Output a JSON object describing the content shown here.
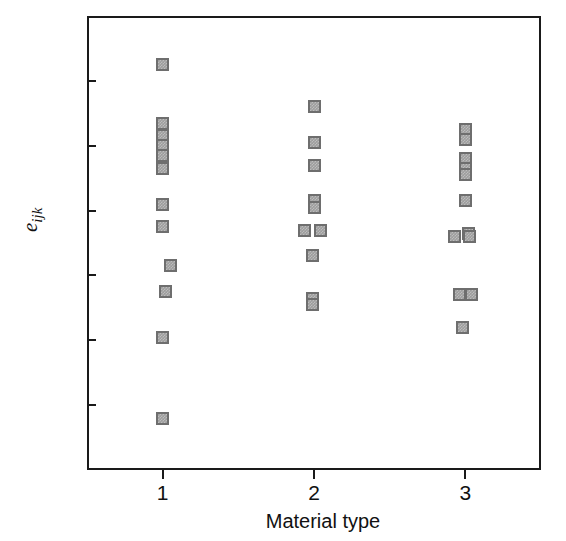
{
  "chart_data": {
    "type": "scatter",
    "title": "",
    "xlabel": "Material type",
    "ylabel": "e_ijk",
    "ylabel_parts": {
      "base": "e",
      "subscript": "ijk"
    },
    "xlim": [
      0.5,
      3.5
    ],
    "ylim": [
      -80,
      60
    ],
    "grid": false,
    "legend": null,
    "x_tick_labels": [
      "1",
      "2",
      "3"
    ],
    "x_tick_values": [
      1,
      2,
      3
    ],
    "y_tick_labels": [
      "60",
      "40",
      "20",
      "0",
      "−20",
      "−40",
      "−60",
      "−80"
    ],
    "y_tick_values": [
      60,
      40,
      20,
      0,
      -20,
      -40,
      -60,
      -80
    ],
    "marker": {
      "shape": "square",
      "fill_color": "#9d9d9d",
      "edge_color": "#6e6e6e",
      "size_px": 13
    },
    "frame_color": "#1a1a1a",
    "background_color": "#ffffff",
    "series": [
      {
        "name": "Material type 1",
        "x": 1,
        "values": [
          45,
          27,
          23,
          20,
          17,
          13,
          2,
          -5,
          -17,
          -25,
          -39,
          -64
        ],
        "points": [
          {
            "x": 1.0,
            "y": 45
          },
          {
            "x": 1.0,
            "y": 27
          },
          {
            "x": 1.0,
            "y": 23
          },
          {
            "x": 1.0,
            "y": 20
          },
          {
            "x": 1.0,
            "y": 17
          },
          {
            "x": 1.0,
            "y": 13
          },
          {
            "x": 1.0,
            "y": 2
          },
          {
            "x": 1.0,
            "y": -5
          },
          {
            "x": 1.05,
            "y": -17
          },
          {
            "x": 1.02,
            "y": -25
          },
          {
            "x": 1.0,
            "y": -39
          },
          {
            "x": 1.0,
            "y": -64
          }
        ]
      },
      {
        "name": "Material type 2",
        "x": 2,
        "values": [
          32,
          21,
          14,
          3,
          1,
          -6,
          -6,
          -14,
          -27,
          -29
        ],
        "points": [
          {
            "x": 2.0,
            "y": 32
          },
          {
            "x": 2.0,
            "y": 21
          },
          {
            "x": 2.0,
            "y": 14
          },
          {
            "x": 2.0,
            "y": 3
          },
          {
            "x": 2.0,
            "y": 1
          },
          {
            "x": 1.94,
            "y": -6
          },
          {
            "x": 2.04,
            "y": -6
          },
          {
            "x": 1.99,
            "y": -14
          },
          {
            "x": 1.99,
            "y": -27
          },
          {
            "x": 1.99,
            "y": -29
          }
        ]
      },
      {
        "name": "Material type 3",
        "x": 3,
        "values": [
          25,
          22,
          16,
          13,
          11,
          3,
          -7,
          -7,
          -8,
          -26,
          -27,
          -36
        ],
        "points": [
          {
            "x": 3.0,
            "y": 25
          },
          {
            "x": 3.0,
            "y": 22
          },
          {
            "x": 3.0,
            "y": 16
          },
          {
            "x": 3.0,
            "y": 13
          },
          {
            "x": 3.0,
            "y": 11
          },
          {
            "x": 3.0,
            "y": 3
          },
          {
            "x": 3.02,
            "y": -7
          },
          {
            "x": 2.93,
            "y": -8
          },
          {
            "x": 3.03,
            "y": -8
          },
          {
            "x": 2.96,
            "y": -26
          },
          {
            "x": 3.04,
            "y": -26
          },
          {
            "x": 2.98,
            "y": -36
          }
        ]
      }
    ]
  }
}
